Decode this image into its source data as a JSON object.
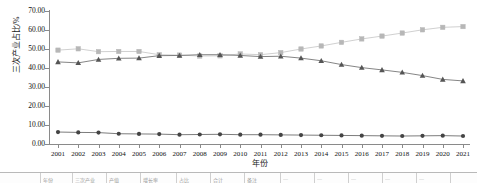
{
  "chart_data": {
    "type": "line",
    "title": "",
    "xlabel": "年份",
    "ylabel": "三次产业占比/%",
    "grid": false,
    "legend": "none",
    "ylim": [
      0,
      70
    ],
    "ytick_step": 10,
    "ytick_labels": [
      "70.00",
      "60.00",
      "50.00",
      "40.00",
      "30.00",
      "20.00",
      "10.00",
      "0.00"
    ],
    "ytick_values": [
      70,
      60,
      50,
      40,
      30,
      20,
      10,
      0
    ],
    "categories": [
      "2001",
      "2002",
      "2003",
      "2004",
      "2005",
      "2006",
      "2007",
      "2008",
      "2009",
      "2010",
      "2011",
      "2012",
      "2013",
      "2014",
      "2015",
      "2016",
      "2017",
      "2018",
      "2019",
      "2020",
      "2021"
    ],
    "x": [
      2001,
      2002,
      2003,
      2004,
      2005,
      2006,
      2007,
      2008,
      2009,
      2010,
      2011,
      2012,
      2013,
      2014,
      2015,
      2016,
      2017,
      2018,
      2019,
      2020,
      2021
    ],
    "series": [
      {
        "name": "第三产业占比",
        "marker": "square",
        "color": "#b7b7b7",
        "line_color": "#c4c4c4",
        "values": [
          49.4,
          50.1,
          48.6,
          48.7,
          48.7,
          47.0,
          46.8,
          46.3,
          46.4,
          47.4,
          47.0,
          48.1,
          50.0,
          51.6,
          53.5,
          55.3,
          56.8,
          58.4,
          60.1,
          61.4,
          61.8
        ]
      },
      {
        "name": "第二产业占比",
        "marker": "triangle",
        "color": "#555555",
        "line_color": "#666666",
        "values": [
          43.2,
          42.7,
          44.5,
          45.1,
          45.2,
          46.5,
          46.6,
          47.0,
          47.0,
          46.6,
          46.0,
          46.2,
          45.2,
          43.8,
          41.8,
          40.2,
          39.0,
          37.7,
          36.0,
          34.0,
          33.2
        ]
      },
      {
        "name": "第一产业占比",
        "marker": "circle",
        "color": "#444444",
        "line_color": "#5a5a5a",
        "values": [
          6.3,
          6.1,
          6.0,
          5.4,
          5.3,
          5.2,
          4.9,
          5.0,
          5.1,
          4.9,
          4.9,
          4.8,
          4.7,
          4.6,
          4.5,
          4.4,
          4.3,
          4.2,
          4.3,
          4.4,
          4.2
        ]
      }
    ]
  },
  "bottom_strip": {
    "cells": [
      "年份",
      "三次产业",
      "产值",
      "增长率",
      "占比",
      "合计",
      "备注",
      "—",
      "—",
      "—",
      "—",
      "—"
    ]
  }
}
